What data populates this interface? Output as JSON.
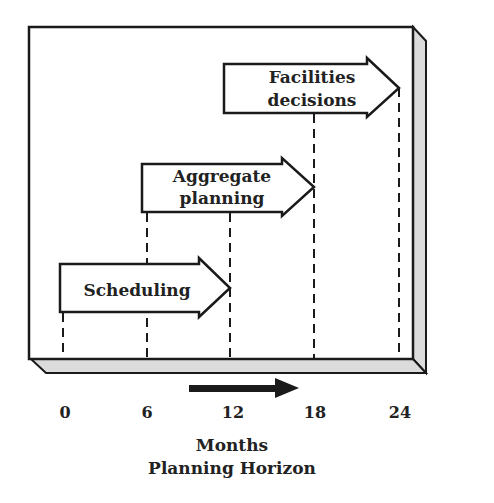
{
  "diagram": {
    "arrows": [
      {
        "lines": [
          "Scheduling"
        ],
        "start": 0,
        "end": 12
      },
      {
        "lines": [
          "Aggregate",
          "planning"
        ],
        "start": 6,
        "end": 18
      },
      {
        "lines": [
          "Facilities",
          "decisions"
        ],
        "start": 12,
        "end": 24
      }
    ],
    "ticks": [
      "0",
      "6",
      "12",
      "18",
      "24"
    ],
    "axis_title": "Months",
    "axis_subtitle": "Planning Horizon",
    "colors": {
      "line": "#1a1a1a",
      "shadow": "#dcdcdc",
      "background": "#ffffff"
    }
  }
}
